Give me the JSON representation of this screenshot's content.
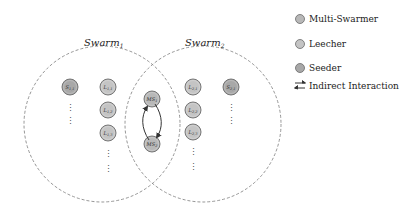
{
  "swarms": [
    {
      "id": "swarm1",
      "title": "Swarm",
      "subscript": "1"
    },
    {
      "id": "swarm2",
      "title": "Swarm",
      "subscript": "2"
    }
  ],
  "nodes": [
    {
      "id": "s11",
      "type": "seeder",
      "label": "S",
      "sub": "1,1"
    },
    {
      "id": "l11",
      "type": "leecher",
      "label": "L",
      "sub": "1,1"
    },
    {
      "id": "l12",
      "type": "leecher",
      "label": "L",
      "sub": "1,2"
    },
    {
      "id": "l13",
      "type": "leecher",
      "label": "L",
      "sub": "1,3"
    },
    {
      "id": "ms1",
      "type": "multi-swarmer",
      "label": "MS",
      "sub": "1"
    },
    {
      "id": "ms2",
      "type": "multi-swarmer",
      "label": "MS",
      "sub": "2"
    },
    {
      "id": "l21",
      "type": "leecher",
      "label": "L",
      "sub": "2,1"
    },
    {
      "id": "l22",
      "type": "leecher",
      "label": "L",
      "sub": "2,2"
    },
    {
      "id": "l23",
      "type": "leecher",
      "label": "L",
      "sub": "2,3"
    },
    {
      "id": "s21",
      "type": "seeder",
      "label": "S",
      "sub": "2,1"
    }
  ],
  "edges": [
    {
      "from": "ms2",
      "to": "ms1",
      "type": "indirect-interaction"
    },
    {
      "from": "ms1",
      "to": "ms2",
      "type": "indirect-interaction"
    }
  ],
  "ellipsis": "⋮",
  "legend": {
    "items": [
      {
        "name": "multi-swarmer",
        "label": "Multi-Swarmer",
        "symbol": "circle"
      },
      {
        "name": "leecher",
        "label": "Leecher",
        "symbol": "circle"
      },
      {
        "name": "seeder",
        "label": "Seeder",
        "symbol": "circle"
      },
      {
        "name": "indirect-interaction",
        "label": "Indirect Interaction",
        "symbol": "double-arrow"
      }
    ]
  },
  "colors": {
    "multi_swarmer": "#b8b8b8",
    "leecher": "#c4c4c4",
    "seeder": "#a8a8a8",
    "node_stroke": "#6a6a6a",
    "swarm_border": "#8a8a8a",
    "arrow": "#333333"
  }
}
